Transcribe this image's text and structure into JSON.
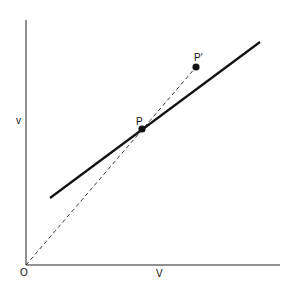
{
  "diagram": {
    "axes": {
      "origin_label": "O",
      "x_label": "V",
      "y_label": "v"
    },
    "points": [
      {
        "id": "P",
        "label": "P",
        "x": 142,
        "y": 129
      },
      {
        "id": "P_prime",
        "label": "P′",
        "x": 196,
        "y": 67
      }
    ],
    "lines": [
      {
        "id": "solid-line",
        "style": "solid",
        "from": [
          50,
          198
        ],
        "to": [
          260,
          42
        ]
      },
      {
        "id": "dashed-ray",
        "style": "dashed",
        "from": [
          26,
          265
        ],
        "to": [
          196,
          67
        ]
      }
    ],
    "colors": {
      "ink": "#111111",
      "background": "#ffffff"
    }
  }
}
